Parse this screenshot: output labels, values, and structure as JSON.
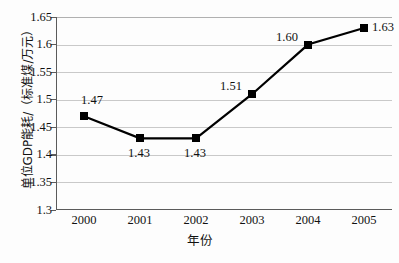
{
  "chart_data": {
    "type": "line",
    "title": "",
    "xlabel": "年份",
    "ylabel": "单位GDP能耗/（标准煤/万元）",
    "categories": [
      "2000",
      "2001",
      "2002",
      "2003",
      "2004",
      "2005"
    ],
    "values": [
      1.47,
      1.43,
      1.43,
      1.51,
      1.6,
      1.63
    ],
    "point_labels": [
      "1.47",
      "1.43",
      "1.43",
      "1.51",
      "1.60",
      "1.63"
    ],
    "point_label_positions": [
      "above",
      "below",
      "below",
      "above-left",
      "above-left",
      "right"
    ],
    "ylim": [
      1.3,
      1.65
    ],
    "yticks": [
      1.3,
      1.35,
      1.4,
      1.45,
      1.5,
      1.55,
      1.6,
      1.65
    ],
    "ytick_labels": [
      "1.3",
      "1.35",
      "1.4",
      "1.45",
      "1.5",
      "1.55",
      "1.6",
      "1.65"
    ],
    "grid": true,
    "grid_axis": "y",
    "legend": false,
    "marker": "square",
    "marker_color": "#000000",
    "line_color": "#000000",
    "grid_color": "#c9c9c9",
    "axis_color": "#5b5b5b",
    "background": "#fdfdfd"
  }
}
